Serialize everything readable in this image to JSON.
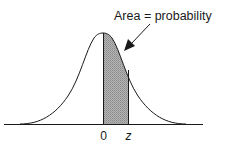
{
  "diagram": {
    "type": "normal-distribution",
    "annotation": "Area = probability",
    "x_labels": {
      "origin": "0",
      "z": "z"
    },
    "shaded_region": {
      "from": "0",
      "to": "z",
      "fill": "#a8a8a8"
    },
    "colors": {
      "stroke": "#1a1a1a",
      "shade": "#a8a8a8",
      "background": "#ffffff"
    }
  }
}
